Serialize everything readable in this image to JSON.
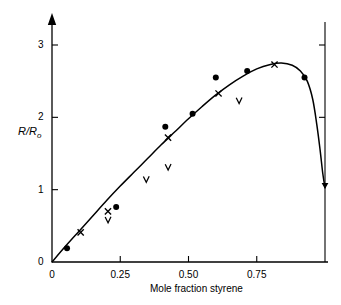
{
  "chart_data": {
    "type": "scatter",
    "title": "",
    "xlabel": "Mole fraction styrene",
    "ylabel": "R/R0",
    "ylabel_base": "R/R",
    "ylabel_sub": "o",
    "xlim": [
      0,
      1.0
    ],
    "ylim": [
      0,
      3.25
    ],
    "xticks": [
      0,
      0.25,
      0.5,
      0.75
    ],
    "xtick_labels": [
      "0",
      "0.25",
      "0.50",
      "0.75"
    ],
    "yticks": [
      0,
      1,
      2,
      3
    ],
    "ytick_labels": [
      "0",
      "1",
      "2",
      "3"
    ],
    "grid": false,
    "legend": "none",
    "right_axis": true,
    "right_axis_ticks": [
      2,
      3
    ],
    "series": [
      {
        "name": "filled-circle",
        "marker": "circle",
        "points": [
          {
            "x": 0.055,
            "y": 0.19
          },
          {
            "x": 0.235,
            "y": 0.76
          },
          {
            "x": 0.415,
            "y": 1.87
          },
          {
            "x": 0.515,
            "y": 2.05
          },
          {
            "x": 0.6,
            "y": 2.55
          },
          {
            "x": 0.715,
            "y": 2.64
          },
          {
            "x": 0.925,
            "y": 2.55
          }
        ]
      },
      {
        "name": "cross",
        "marker": "x",
        "points": [
          {
            "x": 0.105,
            "y": 0.41
          },
          {
            "x": 0.205,
            "y": 0.7
          },
          {
            "x": 0.425,
            "y": 1.72
          },
          {
            "x": 0.61,
            "y": 2.33
          },
          {
            "x": 0.815,
            "y": 2.73
          }
        ]
      },
      {
        "name": "vee",
        "marker": "v",
        "points": [
          {
            "x": 0.205,
            "y": 0.58
          },
          {
            "x": 0.345,
            "y": 1.14
          },
          {
            "x": 0.425,
            "y": 1.31
          },
          {
            "x": 0.685,
            "y": 2.23
          }
        ]
      }
    ],
    "curve": {
      "name": "fitted-curve",
      "points": [
        {
          "x": 0.0,
          "y": 0.0
        },
        {
          "x": 0.05,
          "y": 0.22
        },
        {
          "x": 0.1,
          "y": 0.43
        },
        {
          "x": 0.15,
          "y": 0.64
        },
        {
          "x": 0.2,
          "y": 0.85
        },
        {
          "x": 0.25,
          "y": 1.05
        },
        {
          "x": 0.3,
          "y": 1.24
        },
        {
          "x": 0.35,
          "y": 1.43
        },
        {
          "x": 0.4,
          "y": 1.62
        },
        {
          "x": 0.45,
          "y": 1.8
        },
        {
          "x": 0.5,
          "y": 1.98
        },
        {
          "x": 0.55,
          "y": 2.15
        },
        {
          "x": 0.6,
          "y": 2.31
        },
        {
          "x": 0.65,
          "y": 2.45
        },
        {
          "x": 0.7,
          "y": 2.57
        },
        {
          "x": 0.75,
          "y": 2.67
        },
        {
          "x": 0.8,
          "y": 2.73
        },
        {
          "x": 0.84,
          "y": 2.75
        },
        {
          "x": 0.88,
          "y": 2.72
        },
        {
          "x": 0.91,
          "y": 2.64
        },
        {
          "x": 0.935,
          "y": 2.5
        },
        {
          "x": 0.955,
          "y": 2.25
        },
        {
          "x": 0.97,
          "y": 1.9
        },
        {
          "x": 0.982,
          "y": 1.55
        },
        {
          "x": 0.992,
          "y": 1.22
        },
        {
          "x": 1.0,
          "y": 1.03
        }
      ]
    },
    "colors": {
      "axis": "#000000",
      "curve": "#000000",
      "marker": "#000000",
      "background": "#ffffff"
    }
  }
}
